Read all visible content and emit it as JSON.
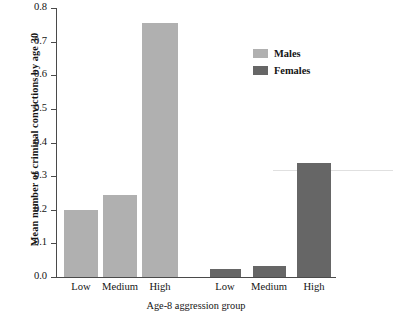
{
  "chart_data": {
    "type": "bar",
    "title": "",
    "xlabel": "Age-8 aggression group",
    "ylabel": "Mean number of criminal convictions by age 30",
    "categories": [
      "Low",
      "Medium",
      "High"
    ],
    "group_order": [
      "Males",
      "Females"
    ],
    "series": [
      {
        "name": "Males",
        "color": "#b0b0b0",
        "values": [
          0.2,
          0.245,
          0.755
        ]
      },
      {
        "name": "Females",
        "color": "#666666",
        "values": [
          0.025,
          0.033,
          0.34
        ]
      }
    ],
    "ylim": [
      0.0,
      0.8
    ],
    "ytick_labels": [
      "0.8",
      "0.7",
      "0.6",
      "0.5",
      "0.4",
      "0.3",
      "0.2",
      "0.1",
      "0.0"
    ],
    "ytick_values": [
      0.8,
      0.7,
      0.6,
      0.5,
      0.4,
      0.3,
      0.2,
      0.1,
      0.0
    ],
    "xtick_labels": [
      "Low",
      "Medium",
      "High",
      "Low",
      "Medium",
      "High"
    ],
    "grid": false,
    "legend_position": "top-right",
    "legend": [
      {
        "label": "Males",
        "color": "#b0b0b0"
      },
      {
        "label": "Females",
        "color": "#666666"
      }
    ]
  },
  "bars": [
    {
      "label": "Low",
      "group": "Males",
      "value": 0.2,
      "left": 7,
      "width": 34
    },
    {
      "label": "Medium",
      "group": "Males",
      "value": 0.245,
      "left": 46,
      "width": 34
    },
    {
      "label": "High",
      "group": "Males",
      "value": 0.755,
      "left": 85,
      "width": 36
    },
    {
      "label": "Low",
      "group": "Females",
      "value": 0.025,
      "left": 153,
      "width": 31
    },
    {
      "label": "Medium",
      "group": "Females",
      "value": 0.033,
      "left": 196,
      "width": 33
    },
    {
      "label": "High",
      "group": "Females",
      "value": 0.34,
      "left": 240,
      "width": 34
    }
  ],
  "xtick_positions": [
    {
      "label": "Low",
      "center": 81
    },
    {
      "label": "Medium",
      "center": 120
    },
    {
      "label": "High",
      "center": 160
    },
    {
      "label": "Low",
      "center": 225
    },
    {
      "label": "Medium",
      "center": 269
    },
    {
      "label": "High",
      "center": 314
    }
  ]
}
